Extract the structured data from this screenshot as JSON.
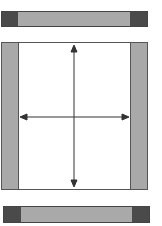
{
  "diagram": {
    "colors": {
      "bar_fill": "#a9a9a9",
      "bar_end": "#4a4a4a",
      "strip_fill": "#a9a9a9",
      "frame_border": "#555555",
      "arrow": "#333333"
    },
    "top_bar": {
      "x": 1,
      "y": 11,
      "w": 147,
      "h": 16,
      "end_w": 16
    },
    "frame": {
      "x": 1,
      "y": 42,
      "w": 147,
      "h": 148,
      "strip_w": 17
    },
    "bottom_bar": {
      "x": 3,
      "y": 206,
      "w": 147,
      "h": 17,
      "end_w": 17
    },
    "arrows": {
      "vertical": {
        "x": 74,
        "y1": 46,
        "y2": 186
      },
      "horizontal": {
        "y": 117,
        "x1": 21,
        "x2": 128
      }
    }
  }
}
